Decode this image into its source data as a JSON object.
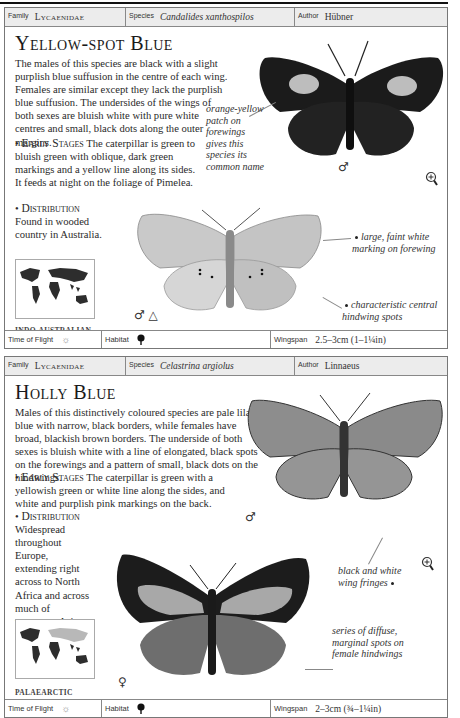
{
  "entries": [
    {
      "header": {
        "family_label": "Family",
        "family": "Lycaenidae",
        "species_label": "Species",
        "species": "Candalides xanthospilos",
        "author_label": "Author",
        "author": "Hübner"
      },
      "title": "Yellow-spot Blue",
      "description": "The males of this species are black with a slight purplish blue suffusion in the centre of each wing. Females are similar except they lack the purplish blue suffusion. The undersides of the wings of both sexes are bluish white with pure white centres and small, black dots along the outer margins.",
      "early_stages_heading": "Early Stages",
      "early_stages": "The caterpillar is green to bluish green with oblique, dark green markings and a yellow line along its sides. It feeds at night on the foliage of Pimelea.",
      "distribution_heading": "Distribution",
      "distribution": "Found in wooded country in Australia.",
      "region": "INDO-AUSTRALIAN",
      "annotations": [
        "orange-yellow patch on forewings gives this species its common name",
        "large, faint white marking on forewing",
        "characteristic central hindwing spots"
      ],
      "symbols": [
        "♂",
        "♂ △"
      ],
      "footer": {
        "time_of_flight_label": "Time of Flight",
        "time_of_flight_icon": "sun-icon",
        "habitat_label": "Habitat",
        "habitat_icon": "tree-icon",
        "wingspan_label": "Wingspan",
        "wingspan": "2.5–3cm (1–1¼in)"
      }
    },
    {
      "header": {
        "family_label": "Family",
        "family": "Lycaenidae",
        "species_label": "Species",
        "species": "Celastrina argiolus",
        "author_label": "Author",
        "author": "Linnaeus"
      },
      "title": "Holly Blue",
      "description": "Males of this distinctively coloured species are pale lilac-blue with narrow, black borders, while females have broad, blackish brown borders. The underside of both sexes is bluish white with a line of elongated, black spots on the forewings and a pattern of small, black dots on the hindwings.",
      "early_stages_heading": "Early Stages",
      "early_stages": "The caterpillar is green with a yellowish green or white line along the sides, and white and purplish pink markings on the back.",
      "distribution_heading": "Distribution",
      "distribution": "Widespread throughout Europe, extending right across to North Africa and across much of temperate Asia as far as Japan.",
      "region": "PALAEARCTIC",
      "annotations": [
        "black and white wing fringes",
        "series of diffuse, marginal spots on female hindwings"
      ],
      "symbols": [
        "♂",
        "♀"
      ],
      "footer": {
        "time_of_flight_label": "Time of Flight",
        "time_of_flight_icon": "sun-icon",
        "habitat_label": "Habitat",
        "habitat_icon": "tree-icon",
        "wingspan_label": "Wingspan",
        "wingspan": "2–3cm (¾–1¼in)"
      }
    }
  ]
}
